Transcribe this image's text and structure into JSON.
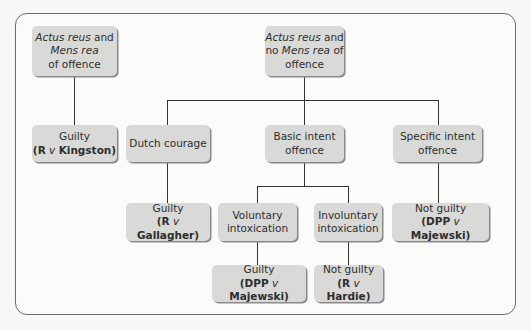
{
  "nodes": {
    "root_guilty": {
      "line1_italic_a": "Actus reus",
      "line1_rest": " and",
      "line2_italic": "Mens rea",
      "line3": "of offence"
    },
    "root_no_mens": {
      "line1_italic_a": "Actus reus",
      "line1_rest": " and",
      "line2_pre": "no ",
      "line2_italic": "Mens rea",
      "line2_post": " of",
      "line3": "offence"
    },
    "guilty_kingston": {
      "verdict": "Guilty",
      "case_open": "(",
      "party1": "R",
      "v": " v ",
      "party2": "Kingston",
      "case_close": ")"
    },
    "dutch_courage": {
      "label": "Dutch courage"
    },
    "basic_intent": {
      "line1": "Basic intent",
      "line2": "offence"
    },
    "specific_intent": {
      "line1": "Specific intent",
      "line2": "offence"
    },
    "guilty_gallagher": {
      "verdict": "Guilty",
      "case_open": "(",
      "party1": "R",
      "v": " v ",
      "party2": "Gallagher",
      "case_close": ")"
    },
    "voluntary": {
      "line1": "Voluntary",
      "line2": "intoxication"
    },
    "involuntary": {
      "line1": "Involuntary",
      "line2": "intoxication"
    },
    "not_guilty_majewski": {
      "verdict": "Not guilty",
      "case_open": "(",
      "party1": "DPP",
      "v": " v ",
      "party2": "Majewski",
      "case_close": ")"
    },
    "guilty_majewski": {
      "verdict": "Guilty",
      "case_open": "(",
      "party1": "DPP",
      "v": " v ",
      "party2": "Majewski",
      "case_close": ")"
    },
    "not_guilty_hardie": {
      "verdict": "Not guilty",
      "case_open": "(",
      "party1": "R",
      "v": " v ",
      "party2": "Hardie",
      "case_close": ")"
    }
  }
}
